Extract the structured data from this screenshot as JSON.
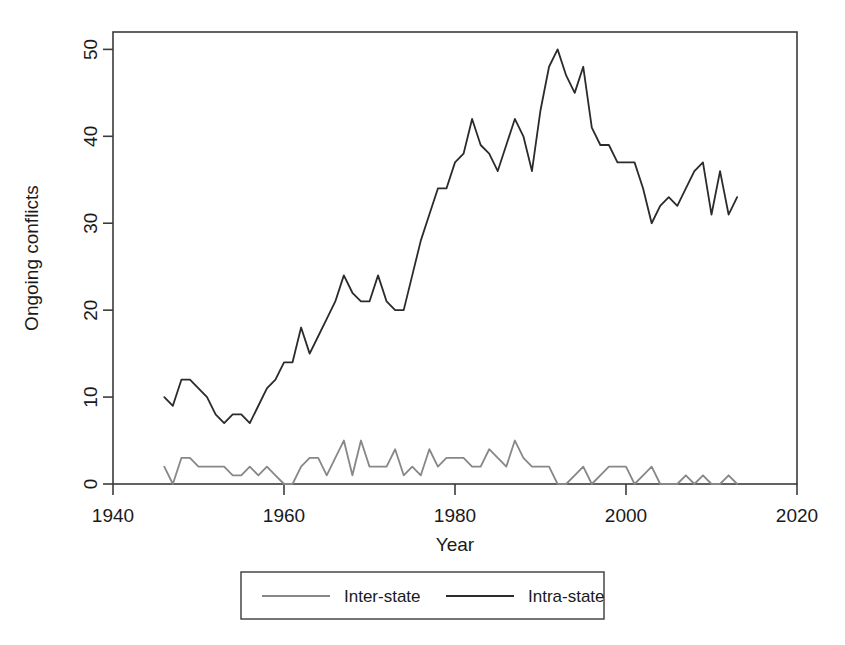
{
  "chart_data": {
    "type": "line",
    "title": "",
    "xlabel": "Year",
    "ylabel": "Ongoing conflicts",
    "xlim": [
      1940,
      2020
    ],
    "ylim": [
      0,
      52
    ],
    "xticks": [
      1940,
      1960,
      1980,
      2000,
      2020
    ],
    "yticks": [
      0,
      10,
      20,
      30,
      40,
      50
    ],
    "xtick_labels": [
      "1940",
      "1960",
      "1980",
      "2000",
      "2020"
    ],
    "ytick_labels": [
      "0",
      "10",
      "20",
      "30",
      "40",
      "50"
    ],
    "grid": false,
    "legend_position": "bottom-outside",
    "x": [
      1946,
      1947,
      1948,
      1949,
      1950,
      1951,
      1952,
      1953,
      1954,
      1955,
      1956,
      1957,
      1958,
      1959,
      1960,
      1961,
      1962,
      1963,
      1964,
      1965,
      1966,
      1967,
      1968,
      1969,
      1970,
      1971,
      1972,
      1973,
      1974,
      1975,
      1976,
      1977,
      1978,
      1979,
      1980,
      1981,
      1982,
      1983,
      1984,
      1985,
      1986,
      1987,
      1988,
      1989,
      1990,
      1991,
      1992,
      1993,
      1994,
      1995,
      1996,
      1997,
      1998,
      1999,
      2000,
      2001,
      2002,
      2003,
      2004,
      2005,
      2006,
      2007,
      2008,
      2009,
      2010,
      2011,
      2012,
      2013
    ],
    "series": [
      {
        "name": "Inter-state",
        "color": "#878787",
        "values": [
          2,
          0,
          3,
          3,
          2,
          2,
          2,
          2,
          1,
          1,
          2,
          1,
          2,
          1,
          0,
          0,
          2,
          3,
          3,
          1,
          3,
          5,
          1,
          5,
          2,
          2,
          2,
          4,
          1,
          2,
          1,
          4,
          2,
          3,
          3,
          3,
          2,
          2,
          4,
          3,
          2,
          5,
          3,
          2,
          2,
          2,
          0,
          0,
          1,
          2,
          0,
          1,
          2,
          2,
          2,
          0,
          1,
          2,
          0,
          0,
          0,
          1,
          0,
          1,
          0,
          0,
          1,
          0
        ]
      },
      {
        "name": "Intra-state",
        "color": "#2b2b2b",
        "values": [
          10,
          9,
          12,
          12,
          11,
          10,
          8,
          7,
          8,
          8,
          7,
          9,
          11,
          12,
          14,
          14,
          18,
          15,
          17,
          19,
          21,
          24,
          22,
          21,
          21,
          24,
          21,
          20,
          20,
          24,
          28,
          31,
          34,
          34,
          37,
          38,
          42,
          39,
          38,
          36,
          39,
          42,
          40,
          36,
          43,
          48,
          50,
          47,
          45,
          48,
          41,
          39,
          39,
          37,
          37,
          37,
          34,
          30,
          32,
          33,
          32,
          34,
          36,
          37,
          31,
          36,
          31,
          33
        ]
      }
    ]
  },
  "legend": {
    "entries": [
      {
        "label": "Inter-state",
        "color": "#878787"
      },
      {
        "label": "Intra-state",
        "color": "#2b2b2b"
      }
    ]
  },
  "axes": {
    "x_title": "Year",
    "y_title": "Ongoing conflicts"
  }
}
